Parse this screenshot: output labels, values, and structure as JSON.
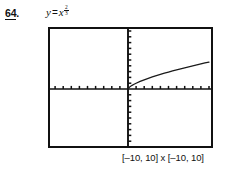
{
  "problem": {
    "number": "64",
    "dot": "."
  },
  "equation": {
    "lhs": "y",
    "operator": "=",
    "base": "x",
    "exponent_numerator": "2",
    "exponent_denominator": "3",
    "plain": "y = x^(2/3)"
  },
  "window_range": {
    "caption": "[–10, 10] x [–10, 10]"
  },
  "colors": {
    "ink": "#111111",
    "background": "#ffffff",
    "curve": "#1a1a1a"
  },
  "chart_data": {
    "type": "line",
    "xlabel": "",
    "ylabel": "",
    "xlim": [
      -10,
      10
    ],
    "ylim": [
      -10,
      10
    ],
    "grid": false,
    "legend": false,
    "axis_style": "graphing-calculator-ticks",
    "x_tick_interval": 1,
    "y_tick_interval": 1,
    "domain_drawn": [
      0,
      10
    ],
    "series": [
      {
        "name": "y = x^(2/3)",
        "x": [
          0,
          0.25,
          0.5,
          0.75,
          1,
          1.5,
          2,
          2.5,
          3,
          3.5,
          4,
          4.5,
          5,
          5.5,
          6,
          6.5,
          7,
          7.5,
          8,
          8.5,
          9,
          9.5,
          10
        ],
        "y": [
          0,
          0.397,
          0.63,
          0.825,
          1,
          1.31,
          1.587,
          1.842,
          2.08,
          2.305,
          2.52,
          2.726,
          2.924,
          3.116,
          3.302,
          3.482,
          3.659,
          3.83,
          4,
          4.165,
          4.327,
          4.486,
          4.642
        ]
      }
    ]
  }
}
